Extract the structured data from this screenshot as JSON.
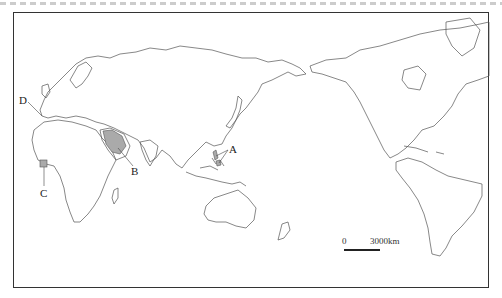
{
  "caption": {
    "visible": "cropped"
  },
  "map": {
    "projection": "world, Pacific-centered",
    "outline_color": "#555555",
    "highlight_fill": "#aaaaaa",
    "labels": [
      {
        "id": "A",
        "text": "A",
        "x": 229,
        "y": 144
      },
      {
        "id": "B",
        "text": "B",
        "x": 131,
        "y": 166
      },
      {
        "id": "C",
        "text": "C",
        "x": 40,
        "y": 188
      },
      {
        "id": "D",
        "text": "D",
        "x": 19,
        "y": 95
      }
    ],
    "scale": {
      "zero": "0",
      "distance": "3000km"
    }
  }
}
